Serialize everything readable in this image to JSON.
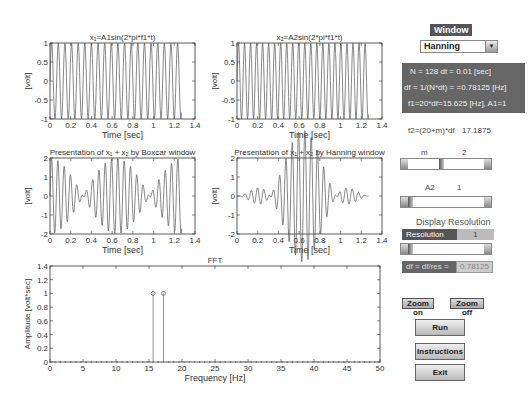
{
  "plots": {
    "x1": {
      "title": "x₁=A1sin(2*pi*f1*t)",
      "ylabel": "[volt]",
      "xlabel": "Time [sec]",
      "yticks": [
        "1",
        "0.5",
        "0",
        "-0.5",
        "-1"
      ],
      "xticks": [
        "0",
        "0.2",
        "0.4",
        "0.6",
        "0.8",
        "1",
        "1.2",
        "1.4"
      ]
    },
    "x2": {
      "title": "x₂=A2sin(2*pi*f1*t)",
      "ylabel": "[volt]",
      "xlabel": "Time [sec]",
      "yticks": [
        "1",
        "0.5",
        "0",
        "-0.5",
        "-1"
      ],
      "xticks": [
        "0",
        "0.2",
        "0.4",
        "0.6",
        "0.8",
        "1",
        "1.2",
        "1.4"
      ]
    },
    "boxcar": {
      "title": "Presentation of x₁ + x₂ by Boxcar window",
      "ylabel": "[volt]",
      "xlabel": "Time [sec]",
      "yticks": [
        "2",
        "1",
        "0",
        "-1",
        "-2"
      ],
      "xticks": [
        "0",
        "0.2",
        "0.4",
        "0.6",
        "0.8",
        "1",
        "1.2",
        "1.4"
      ]
    },
    "hanning": {
      "title": "Presentation of x₁ + x₂ by Hanning window",
      "ylabel": "[volt]",
      "xlabel": "Time [sec]",
      "yticks": [
        "2",
        "1",
        "0",
        "-1",
        "-2"
      ],
      "xticks": [
        "0",
        "0.2",
        "0.4",
        "0.6",
        "0.8",
        "1",
        "1.2",
        "1.4"
      ]
    },
    "fft": {
      "title": "FFT",
      "ylabel": "Amplitude [volt*sec]",
      "xlabel": "Frequency [Hz]",
      "yticks": [
        "1.4",
        "1.2",
        "1",
        "0.8",
        "0.6",
        "0.4",
        "0.2",
        "0"
      ],
      "xticks": [
        "0",
        "5",
        "10",
        "15",
        "20",
        "25",
        "30",
        "35",
        "40",
        "45",
        "50"
      ]
    }
  },
  "chart_data": [
    {
      "type": "line",
      "title": "x1=A1sin(2*pi*f1*t)",
      "xlabel": "Time [sec]",
      "ylabel": "[volt]",
      "xlim": [
        0,
        1.4
      ],
      "ylim": [
        -1,
        1
      ],
      "frequency_hz": 15.625,
      "amplitude": 1,
      "t_end": 1.27
    },
    {
      "type": "line",
      "title": "x2=A2sin(2*pi*f1*t)",
      "xlabel": "Time [sec]",
      "ylabel": "[volt]",
      "xlim": [
        0,
        1.4
      ],
      "ylim": [
        -1,
        1
      ],
      "frequency_hz": 17.1875,
      "amplitude": 1,
      "t_end": 1.27
    },
    {
      "type": "line",
      "title": "Presentation of x1 + x2 by Boxcar window",
      "xlabel": "Time [sec]",
      "ylabel": "[volt]",
      "xlim": [
        0,
        1.4
      ],
      "ylim": [
        -2,
        2
      ]
    },
    {
      "type": "line",
      "title": "Presentation of x1 + x2 by Hanning window",
      "xlabel": "Time [sec]",
      "ylabel": "[volt]",
      "xlim": [
        0,
        1.4
      ],
      "ylim": [
        -2,
        2
      ]
    },
    {
      "type": "bar",
      "title": "FFT",
      "xlabel": "Frequency [Hz]",
      "ylabel": "Amplitude [volt*sec]",
      "xlim": [
        0,
        50
      ],
      "ylim": [
        0,
        1.4
      ],
      "x": [
        15.625,
        17.1875
      ],
      "values": [
        1,
        1
      ]
    }
  ],
  "controls": {
    "window_label": "Window",
    "window_select": "Hanning",
    "info_lines": [
      "N = 128 dt = 0.01 [sec]",
      "df = 1/(N*dt) = =0.78125 [Hz]",
      "f1=20*df=15.625 [Hz], A1=1"
    ],
    "f2_label": "f2=(20+m)*df",
    "f2_value": "17.1875",
    "m_label": "m",
    "m_value": "2",
    "a2_label": "A2",
    "a2_value": "1",
    "display_resolution": "Display Resolution",
    "resolution_label": "Resolution",
    "resolution_value": "1",
    "df_label": "df = df/res =",
    "df_value": "0.78125",
    "zoom_on": "Zoom on",
    "zoom_off": "Zoom off",
    "run": "Run",
    "instructions": "Instructions",
    "exit": "Exit"
  }
}
